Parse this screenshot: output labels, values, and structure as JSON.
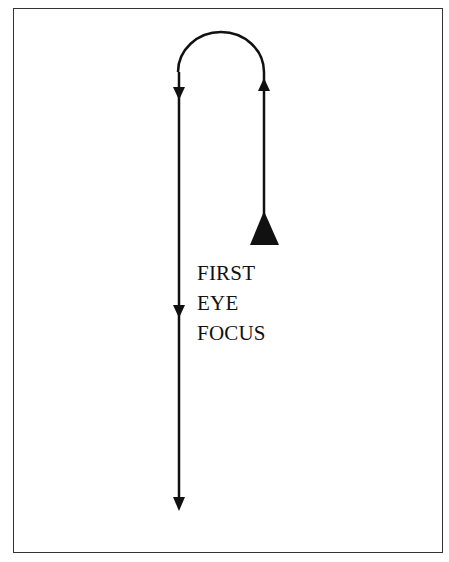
{
  "diagram": {
    "type": "eye-movement-path",
    "label_lines": [
      "FIRST",
      "EYE",
      "FOCUS"
    ],
    "colors": {
      "stroke": "#111111",
      "frame": "#333333",
      "background": "#ffffff"
    },
    "path": {
      "start": "large triangle marker on right line (first eye focus)",
      "sequence": [
        "up right line",
        "over top arc",
        "down left line to bottom"
      ]
    }
  }
}
